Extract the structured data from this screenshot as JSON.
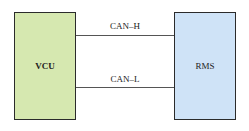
{
  "diagram": {
    "nodes": [
      {
        "id": "vcu",
        "label": "VCU",
        "fill": "#d6e8b0"
      },
      {
        "id": "rms",
        "label": "RMS",
        "fill": "#cfe3f7"
      }
    ],
    "edges": [
      {
        "from": "vcu",
        "to": "rms",
        "label": "CAN–H"
      },
      {
        "from": "vcu",
        "to": "rms",
        "label": "CAN–L"
      }
    ]
  }
}
